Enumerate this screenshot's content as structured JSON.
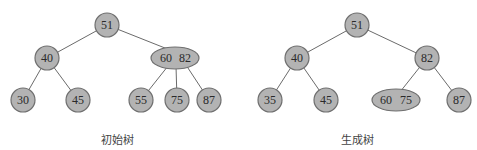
{
  "trees": [
    {
      "caption": "初始树",
      "nodes": [
        {
          "id": "n51",
          "keys": [
            "51"
          ],
          "label": "51"
        },
        {
          "id": "n40",
          "keys": [
            "40"
          ],
          "label": "40"
        },
        {
          "id": "n60_82",
          "keys": [
            "60",
            "82"
          ],
          "k1": "60",
          "k2": "82"
        },
        {
          "id": "n30",
          "keys": [
            "30"
          ],
          "label": "30"
        },
        {
          "id": "n45",
          "keys": [
            "45"
          ],
          "label": "45"
        },
        {
          "id": "n55",
          "keys": [
            "55"
          ],
          "label": "55"
        },
        {
          "id": "n75",
          "keys": [
            "75"
          ],
          "label": "75"
        },
        {
          "id": "n87",
          "keys": [
            "87"
          ],
          "label": "87"
        }
      ],
      "edges": [
        [
          "51",
          "40"
        ],
        [
          "51",
          "60 82"
        ],
        [
          "40",
          "30"
        ],
        [
          "40",
          "45"
        ],
        [
          "60 82",
          "55"
        ],
        [
          "60 82",
          "75"
        ],
        [
          "60 82",
          "87"
        ]
      ]
    },
    {
      "caption": "生成树",
      "nodes": [
        {
          "id": "n51",
          "keys": [
            "51"
          ],
          "label": "51"
        },
        {
          "id": "n40",
          "keys": [
            "40"
          ],
          "label": "40"
        },
        {
          "id": "n82",
          "keys": [
            "82"
          ],
          "label": "82"
        },
        {
          "id": "n35",
          "keys": [
            "35"
          ],
          "label": "35"
        },
        {
          "id": "n45",
          "keys": [
            "45"
          ],
          "label": "45"
        },
        {
          "id": "n60_75",
          "keys": [
            "60",
            "75"
          ],
          "k1": "60",
          "k2": "75"
        },
        {
          "id": "n87",
          "keys": [
            "87"
          ],
          "label": "87"
        }
      ],
      "edges": [
        [
          "51",
          "40"
        ],
        [
          "51",
          "82"
        ],
        [
          "40",
          "35"
        ],
        [
          "40",
          "45"
        ],
        [
          "82",
          "60 75"
        ],
        [
          "82",
          "87"
        ]
      ]
    }
  ],
  "colors": {
    "node_fill": "#b3b3b3",
    "node_stroke": "#6f6f6f",
    "edge": "#6b6b6b"
  }
}
